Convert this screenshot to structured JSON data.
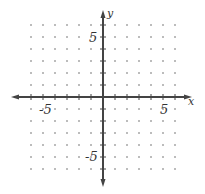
{
  "chart_data": {
    "type": "scatter",
    "title": "",
    "xlabel": "x",
    "ylabel": "y",
    "xlim": [
      -6,
      6
    ],
    "ylim": [
      -6,
      6
    ],
    "grid": "dots",
    "x_ticks": [
      -6,
      -5,
      -4,
      -3,
      -2,
      -1,
      1,
      2,
      3,
      4,
      5,
      6
    ],
    "y_ticks": [
      -6,
      -5,
      -4,
      -3,
      -2,
      -1,
      1,
      2,
      3,
      4,
      5,
      6
    ],
    "tick_labels": {
      "x_neg": "-5",
      "x_pos": "5",
      "y_pos": "5",
      "y_neg": "-5"
    },
    "series": []
  },
  "colors": {
    "axis": "#444444",
    "dot": "#888888",
    "label": "#333333"
  }
}
